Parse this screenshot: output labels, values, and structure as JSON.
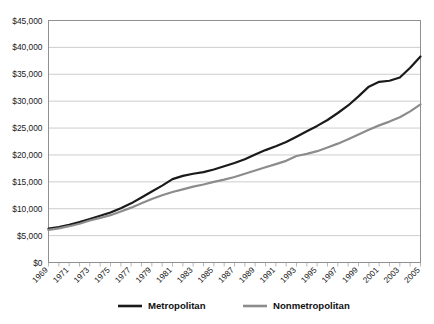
{
  "chart_data": {
    "type": "line",
    "title": "",
    "xlabel": "",
    "ylabel": "",
    "ylim": [
      0,
      45000
    ],
    "ytick_values": [
      0,
      5000,
      10000,
      15000,
      20000,
      25000,
      30000,
      35000,
      40000,
      45000
    ],
    "ytick_labels": [
      "$0",
      "$5,000",
      "$10,000",
      "$15,000",
      "$20,000",
      "$25,000",
      "$30,000",
      "$35,000",
      "$40,000",
      "$45,000"
    ],
    "grid": true,
    "grid_axis": "y",
    "legend_position": "bottom",
    "x": [
      1969,
      1970,
      1971,
      1972,
      1973,
      1974,
      1975,
      1976,
      1977,
      1978,
      1979,
      1980,
      1981,
      1982,
      1983,
      1984,
      1985,
      1986,
      1987,
      1988,
      1989,
      1990,
      1991,
      1992,
      1993,
      1994,
      1995,
      1996,
      1997,
      1998,
      1999,
      2000,
      2001,
      2002,
      2003,
      2004,
      2005
    ],
    "xtick_labels": [
      "1969",
      "1971",
      "1973",
      "1975",
      "1977",
      "1979",
      "1981",
      "1983",
      "1985",
      "1987",
      "1989",
      "1991",
      "1993",
      "1995",
      "1997",
      "1999",
      "2001",
      "2003",
      "2005"
    ],
    "xtick_label_rotation": -45,
    "series": [
      {
        "name": "Metropolitan",
        "color": "#1a1a1a",
        "linewidth": 2.2,
        "values": [
          6300,
          6600,
          7000,
          7500,
          8100,
          8700,
          9300,
          10100,
          11000,
          12100,
          13200,
          14300,
          15500,
          16100,
          16500,
          16800,
          17300,
          17900,
          18500,
          19200,
          20100,
          20900,
          21600,
          22400,
          23400,
          24400,
          25400,
          26500,
          27800,
          29200,
          30900,
          32700,
          33600,
          33800,
          34400,
          36200,
          38300
        ]
      },
      {
        "name": "Nonmetropolitan",
        "color": "#8c8c8c",
        "linewidth": 2.2,
        "values": [
          6050,
          6350,
          6750,
          7200,
          7800,
          8300,
          8800,
          9500,
          10200,
          11000,
          11800,
          12500,
          13100,
          13600,
          14100,
          14500,
          15000,
          15400,
          15900,
          16500,
          17100,
          17700,
          18300,
          18900,
          19800,
          20200,
          20700,
          21400,
          22100,
          22900,
          23800,
          24700,
          25500,
          26200,
          27000,
          28100,
          29400
        ]
      }
    ]
  },
  "legend": {
    "items": [
      {
        "label": "Metropolitan",
        "color": "#1a1a1a"
      },
      {
        "label": "Nonmetropolitan",
        "color": "#8c8c8c"
      }
    ]
  }
}
